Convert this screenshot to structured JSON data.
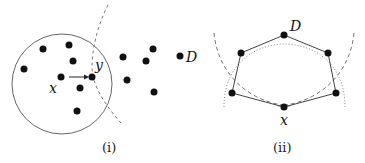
{
  "panels": [
    {
      "caption": "(i)",
      "labels": {
        "x": "x",
        "y": "y",
        "D": "D"
      },
      "circle": {
        "cx": 62,
        "cy": 84,
        "r": 50
      },
      "points": [
        [
          43,
          49
        ],
        [
          69,
          45
        ],
        [
          73,
          61
        ],
        [
          24,
          69
        ],
        [
          61,
          77
        ],
        [
          92,
          77
        ],
        [
          80,
          88
        ],
        [
          77,
          111
        ],
        [
          123,
          57
        ],
        [
          153,
          49
        ],
        [
          146,
          61
        ],
        [
          127,
          80
        ],
        [
          154,
          92
        ],
        [
          180,
          56
        ]
      ]
    },
    {
      "caption": "(ii)",
      "labels": {
        "x": "x",
        "D": "D"
      },
      "polygon": [
        [
          284,
          35
        ],
        [
          328,
          53
        ],
        [
          336,
          93
        ],
        [
          284,
          107
        ],
        [
          232,
          93
        ],
        [
          241,
          53
        ]
      ]
    }
  ],
  "colors": {
    "ink": "#111111",
    "line": "#555555"
  }
}
